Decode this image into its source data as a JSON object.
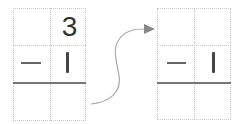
{
  "left_problem": {
    "top_row": [
      "",
      "3"
    ],
    "middle_row": {
      "operator": "−",
      "digit": "1"
    },
    "bottom_row": [
      "",
      ""
    ]
  },
  "right_problem": {
    "top_row": [
      "",
      ""
    ],
    "middle_row": {
      "operator": "−",
      "digit": "1"
    },
    "bottom_row": [
      "",
      ""
    ]
  },
  "arrow": {
    "direction": "left-to-right",
    "color": "#aaaaaa"
  },
  "colors": {
    "grid_dotted": "#c8c8c8",
    "answer_line": "#777777",
    "text": "#333333"
  }
}
